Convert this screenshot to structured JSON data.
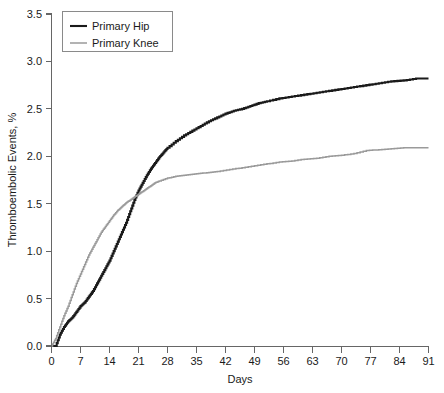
{
  "chart_data": {
    "type": "line",
    "title": "",
    "xlabel": "Days",
    "ylabel": "Thromboembolic Events, %",
    "xlim": [
      0,
      91
    ],
    "ylim": [
      0,
      3.5
    ],
    "xticks": [
      0,
      7,
      14,
      21,
      28,
      35,
      42,
      49,
      56,
      63,
      70,
      77,
      84,
      91
    ],
    "xtick_labels": [
      "0",
      "7",
      "14",
      "21",
      "28",
      "35",
      "42",
      "49",
      "56",
      "63",
      "70",
      "77",
      "84",
      "91"
    ],
    "yticks": [
      0.0,
      0.5,
      1.0,
      1.5,
      2.0,
      2.5,
      3.0,
      3.5
    ],
    "ytick_labels": [
      "0.0",
      "0.5",
      "1.0",
      "1.5",
      "2.0",
      "2.5",
      "3.0",
      "3.5"
    ],
    "grid": false,
    "step_plot": true,
    "legend_position": "top-left",
    "series": [
      {
        "name": "Primary Hip",
        "color": "#1a1a1a",
        "line_width": 2.1,
        "x": [
          0,
          1,
          2,
          3,
          4,
          5,
          6,
          7,
          8,
          9,
          10,
          11,
          12,
          13,
          14,
          15,
          16,
          17,
          18,
          19,
          20,
          21,
          22,
          23,
          24,
          25,
          26,
          27,
          28,
          30,
          32,
          34,
          36,
          38,
          40,
          42,
          44,
          46,
          48,
          50,
          52,
          55,
          58,
          61,
          64,
          67,
          70,
          73,
          76,
          79,
          82,
          85,
          88,
          91
        ],
        "values": [
          0.0,
          0.0,
          0.12,
          0.2,
          0.26,
          0.3,
          0.36,
          0.42,
          0.46,
          0.52,
          0.58,
          0.66,
          0.74,
          0.82,
          0.9,
          1.0,
          1.1,
          1.2,
          1.3,
          1.42,
          1.54,
          1.64,
          1.72,
          1.8,
          1.87,
          1.93,
          1.99,
          2.04,
          2.09,
          2.16,
          2.22,
          2.27,
          2.32,
          2.37,
          2.41,
          2.45,
          2.48,
          2.5,
          2.53,
          2.56,
          2.58,
          2.61,
          2.63,
          2.65,
          2.67,
          2.69,
          2.71,
          2.73,
          2.75,
          2.77,
          2.79,
          2.8,
          2.82,
          2.82
        ]
      },
      {
        "name": "Primary Knee",
        "color": "#9a9a9a",
        "line_width": 1.5,
        "x": [
          0,
          1,
          2,
          3,
          4,
          5,
          6,
          7,
          8,
          9,
          10,
          11,
          12,
          13,
          14,
          15,
          16,
          17,
          18,
          19,
          20,
          21,
          22,
          23,
          24,
          25,
          26,
          28,
          30,
          32,
          34,
          36,
          38,
          40,
          43,
          46,
          49,
          52,
          55,
          58,
          61,
          64,
          67,
          70,
          73,
          76,
          79,
          82,
          85,
          88,
          91
        ],
        "values": [
          0.0,
          0.08,
          0.2,
          0.32,
          0.42,
          0.54,
          0.66,
          0.76,
          0.86,
          0.96,
          1.04,
          1.12,
          1.2,
          1.26,
          1.32,
          1.38,
          1.43,
          1.47,
          1.51,
          1.54,
          1.57,
          1.6,
          1.63,
          1.66,
          1.69,
          1.72,
          1.74,
          1.77,
          1.79,
          1.8,
          1.81,
          1.82,
          1.83,
          1.84,
          1.86,
          1.88,
          1.9,
          1.92,
          1.94,
          1.95,
          1.97,
          1.98,
          2.0,
          2.01,
          2.03,
          2.06,
          2.07,
          2.08,
          2.09,
          2.09,
          2.09
        ]
      }
    ],
    "legend": [
      {
        "label": "Primary Hip",
        "color": "#1a1a1a"
      },
      {
        "label": "Primary Knee",
        "color": "#9a9a9a"
      }
    ],
    "annotations": {
      "crossover_day": 20,
      "crossover_value": 1.55
    }
  },
  "axes": {
    "x_title": "Days",
    "y_title": "Thromboembolic Events, %"
  },
  "colors": {
    "axis": "#666666",
    "text": "#1a1a1a",
    "background": "#ffffff",
    "series_hip": "#1a1a1a",
    "series_knee": "#9a9a9a",
    "legend_border": "#8a8a8a"
  }
}
